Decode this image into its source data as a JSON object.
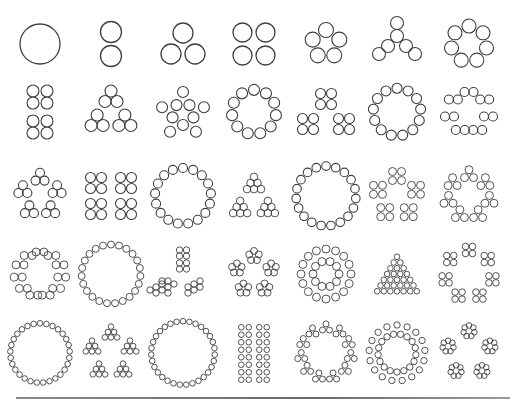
{
  "style": {
    "stroke": "#3f3f3f",
    "background": "#ffffff",
    "rule_color": "#7a7a7a"
  },
  "grid": {
    "rows": 5,
    "cols": 7,
    "col_centers": [
      40,
      111,
      183,
      254,
      326,
      397,
      469
    ],
    "row_centers": [
      44,
      112,
      196,
      274,
      353
    ]
  },
  "cells": [
    {
      "n": 1,
      "pattern": "single",
      "r": 20
    },
    {
      "n": 2,
      "pattern": "column",
      "r": 10.5
    },
    {
      "n": 3,
      "pattern": "triangle",
      "r": 10
    },
    {
      "n": 4,
      "pattern": "square",
      "r": 9.5
    },
    {
      "n": 5,
      "pattern": "ring",
      "r": 7.5
    },
    {
      "n": 6,
      "pattern": "tripod",
      "r": 6.5
    },
    {
      "n": 7,
      "pattern": "ring",
      "r": 7
    },
    {
      "n": 8,
      "pattern": "pairs-column",
      "r": 6
    },
    {
      "n": 9,
      "pattern": "triangle-of-triangles",
      "r": 6
    },
    {
      "n": 10,
      "pattern": "star",
      "r": 5.5
    },
    {
      "n": 11,
      "pattern": "ring",
      "r": 5.5
    },
    {
      "n": 12,
      "pattern": "squares-triangle",
      "r": 5
    },
    {
      "n": 13,
      "pattern": "ring",
      "r": 5
    },
    {
      "n": 14,
      "pattern": "pairs-ring",
      "r": 4.5
    },
    {
      "n": 15,
      "pattern": "triangles-ring",
      "r": 4.5
    },
    {
      "n": 16,
      "pattern": "squares-grid",
      "r": 5
    },
    {
      "n": 17,
      "pattern": "ring",
      "r": 4.5
    },
    {
      "n": 18,
      "pattern": "triangle-of-triangles-big",
      "r": 3.8
    },
    {
      "n": 19,
      "pattern": "ring",
      "r": 4.3
    },
    {
      "n": 20,
      "pattern": "squares-ring",
      "r": 4
    },
    {
      "n": 21,
      "pattern": "triangles-ring7",
      "r": 4
    },
    {
      "n": 22,
      "pattern": "pairs-ring11",
      "r": 4
    },
    {
      "n": 23,
      "pattern": "ring",
      "r": 3.5
    },
    {
      "n": 24,
      "pattern": "tripod-big",
      "r": 3.2
    },
    {
      "n": 25,
      "pattern": "pentagon-groups",
      "r": 3.5
    },
    {
      "n": 26,
      "pattern": "double-ring",
      "r": 4
    },
    {
      "n": 27,
      "pattern": "triangle-full",
      "r": 2.8
    },
    {
      "n": 28,
      "pattern": "squares-ring7",
      "r": 3.3
    },
    {
      "n": 29,
      "pattern": "ring",
      "r": 2.8
    },
    {
      "n": 30,
      "pattern": "star-triangles",
      "r": 2.8
    },
    {
      "n": 31,
      "pattern": "ring",
      "r": 2.8
    },
    {
      "n": 32,
      "pattern": "squares-column",
      "r": 2.8
    },
    {
      "n": 33,
      "pattern": "triangles-ring11",
      "r": 3
    },
    {
      "n": 34,
      "pattern": "double-ring-17",
      "r": 3.2
    },
    {
      "n": 35,
      "pattern": "pentagon-rings",
      "r": 2.8
    }
  ]
}
